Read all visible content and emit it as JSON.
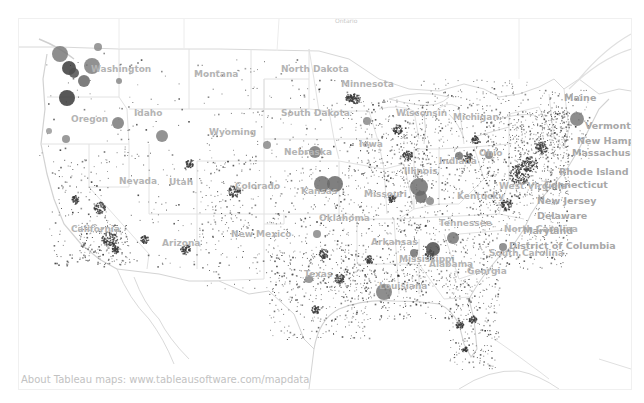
{
  "map": {
    "attribution": "About Tableau maps: www.tableausoftware.com/mapdata",
    "top_label": "Ontario",
    "colors": {
      "border": "#dcdcdc",
      "coast": "#d6d6d6",
      "label": "#b4b4b4",
      "dot": "#3a3a3a",
      "circle": "#6e6e6e"
    },
    "state_labels": [
      {
        "name": "Washington",
        "x": 72,
        "y": 53
      },
      {
        "name": "Oregon",
        "x": 52,
        "y": 103
      },
      {
        "name": "Idaho",
        "x": 115,
        "y": 97
      },
      {
        "name": "Montana",
        "x": 175,
        "y": 58
      },
      {
        "name": "Wyoming",
        "x": 190,
        "y": 116
      },
      {
        "name": "North Dakota",
        "x": 262,
        "y": 53
      },
      {
        "name": "South Dakota",
        "x": 262,
        "y": 97
      },
      {
        "name": "Minnesota",
        "x": 322,
        "y": 68
      },
      {
        "name": "Wisconsin",
        "x": 377,
        "y": 97
      },
      {
        "name": "Michigan",
        "x": 434,
        "y": 101
      },
      {
        "name": "Nebraska",
        "x": 265,
        "y": 136
      },
      {
        "name": "Iowa",
        "x": 340,
        "y": 128
      },
      {
        "name": "Nevada",
        "x": 100,
        "y": 165
      },
      {
        "name": "Utah",
        "x": 150,
        "y": 166
      },
      {
        "name": "Colorado",
        "x": 216,
        "y": 170
      },
      {
        "name": "Kansas",
        "x": 282,
        "y": 175
      },
      {
        "name": "Missouri",
        "x": 345,
        "y": 178
      },
      {
        "name": "Illinois",
        "x": 385,
        "y": 155
      },
      {
        "name": "Indiana",
        "x": 420,
        "y": 145
      },
      {
        "name": "Ohio",
        "x": 460,
        "y": 137
      },
      {
        "name": "Kentucky",
        "x": 438,
        "y": 180
      },
      {
        "name": "West Virginia",
        "x": 480,
        "y": 170
      },
      {
        "name": "California",
        "x": 52,
        "y": 213
      },
      {
        "name": "Arizona",
        "x": 143,
        "y": 227
      },
      {
        "name": "New Mexico",
        "x": 212,
        "y": 218
      },
      {
        "name": "Oklahoma",
        "x": 300,
        "y": 202
      },
      {
        "name": "Arkansas",
        "x": 352,
        "y": 226
      },
      {
        "name": "Tennessee",
        "x": 420,
        "y": 207
      },
      {
        "name": "North Carolina",
        "x": 485,
        "y": 213
      },
      {
        "name": "South Carolina",
        "x": 470,
        "y": 237
      },
      {
        "name": "Mississippi",
        "x": 380,
        "y": 243
      },
      {
        "name": "Alabama",
        "x": 410,
        "y": 248
      },
      {
        "name": "Georgia",
        "x": 448,
        "y": 255
      },
      {
        "name": "Texas",
        "x": 285,
        "y": 258
      },
      {
        "name": "Louisiana",
        "x": 360,
        "y": 270
      }
    ],
    "northeast_labels": [
      {
        "name": "Maine",
        "x": 545,
        "y": 82
      },
      {
        "name": "Vermont",
        "x": 566,
        "y": 110
      },
      {
        "name": "New Hamps",
        "x": 558,
        "y": 125
      },
      {
        "name": "Massachuse",
        "x": 553,
        "y": 137
      },
      {
        "name": "Rhode Island",
        "x": 540,
        "y": 156
      },
      {
        "name": "Connecticut",
        "x": 525,
        "y": 169
      },
      {
        "name": "New Jersey",
        "x": 518,
        "y": 185
      },
      {
        "name": "Delaware",
        "x": 518,
        "y": 200
      },
      {
        "name": "Maryland",
        "x": 504,
        "y": 215
      },
      {
        "name": "District of Columbia",
        "x": 490,
        "y": 230
      }
    ],
    "large_circles": [
      {
        "x": 41,
        "y": 35,
        "r": 8,
        "shade": "#7a7a7a"
      },
      {
        "x": 79,
        "y": 28,
        "r": 4,
        "shade": "#8a8a8a"
      },
      {
        "x": 50,
        "y": 49,
        "r": 7,
        "shade": "#3c3c3c"
      },
      {
        "x": 55,
        "y": 54,
        "r": 5,
        "shade": "#505050"
      },
      {
        "x": 73,
        "y": 47,
        "r": 8,
        "shade": "#7e7e7e"
      },
      {
        "x": 65,
        "y": 62,
        "r": 6,
        "shade": "#666666"
      },
      {
        "x": 100,
        "y": 62,
        "r": 3,
        "shade": "#8a8a8a"
      },
      {
        "x": 48,
        "y": 79,
        "r": 8,
        "shade": "#3a3a3a"
      },
      {
        "x": 99,
        "y": 104,
        "r": 6,
        "shade": "#7a7a7a"
      },
      {
        "x": 47,
        "y": 120,
        "r": 4,
        "shade": "#8a8a8a"
      },
      {
        "x": 30,
        "y": 112,
        "r": 3,
        "shade": "#999999"
      },
      {
        "x": 143,
        "y": 117,
        "r": 6,
        "shade": "#808080"
      },
      {
        "x": 248,
        "y": 126,
        "r": 4,
        "shade": "#8a8a8a"
      },
      {
        "x": 296,
        "y": 133,
        "r": 6,
        "shade": "#7a7a7a"
      },
      {
        "x": 348,
        "y": 102,
        "r": 4,
        "shade": "#8a8a8a"
      },
      {
        "x": 303,
        "y": 165,
        "r": 8,
        "shade": "#6e6e6e"
      },
      {
        "x": 316,
        "y": 165,
        "r": 8,
        "shade": "#6a6a6a"
      },
      {
        "x": 400,
        "y": 168,
        "r": 9,
        "shade": "#707070"
      },
      {
        "x": 402,
        "y": 178,
        "r": 6,
        "shade": "#6a6a6a"
      },
      {
        "x": 411,
        "y": 182,
        "r": 4,
        "shade": "#888888"
      },
      {
        "x": 434,
        "y": 219,
        "r": 6,
        "shade": "#777777"
      },
      {
        "x": 414,
        "y": 230,
        "r": 7,
        "shade": "#4e4e4e"
      },
      {
        "x": 395,
        "y": 234,
        "r": 4,
        "shade": "#707070"
      },
      {
        "x": 484,
        "y": 228,
        "r": 4,
        "shade": "#808080"
      },
      {
        "x": 365,
        "y": 273,
        "r": 8,
        "shade": "#7a7a7a"
      },
      {
        "x": 558,
        "y": 100,
        "r": 7,
        "shade": "#7a7a7a"
      },
      {
        "x": 470,
        "y": 136,
        "r": 4,
        "shade": "#808080"
      },
      {
        "x": 440,
        "y": 137,
        "r": 4,
        "shade": "#707070"
      },
      {
        "x": 298,
        "y": 215,
        "r": 4,
        "shade": "#888888"
      },
      {
        "x": 290,
        "y": 260,
        "r": 4,
        "shade": "#8a8a8a"
      }
    ],
    "dot_clusters": [
      {
        "x": 340,
        "y": 80,
        "w": 70,
        "h": 80,
        "n": 260
      },
      {
        "x": 280,
        "y": 60,
        "w": 60,
        "h": 90,
        "n": 90
      },
      {
        "x": 220,
        "y": 40,
        "w": 60,
        "h": 110,
        "n": 60
      },
      {
        "x": 100,
        "y": 40,
        "w": 120,
        "h": 100,
        "n": 70
      },
      {
        "x": 20,
        "y": 30,
        "w": 100,
        "h": 120,
        "n": 50
      },
      {
        "x": 30,
        "y": 140,
        "w": 60,
        "h": 110,
        "n": 140
      },
      {
        "x": 60,
        "y": 205,
        "w": 50,
        "h": 40,
        "n": 170
      },
      {
        "x": 110,
        "y": 140,
        "w": 100,
        "h": 110,
        "n": 90
      },
      {
        "x": 180,
        "y": 140,
        "w": 60,
        "h": 80,
        "n": 110
      },
      {
        "x": 180,
        "y": 190,
        "w": 80,
        "h": 80,
        "n": 90
      },
      {
        "x": 250,
        "y": 150,
        "w": 80,
        "h": 120,
        "n": 230
      },
      {
        "x": 250,
        "y": 230,
        "w": 100,
        "h": 90,
        "n": 280
      },
      {
        "x": 320,
        "y": 150,
        "w": 80,
        "h": 120,
        "n": 300
      },
      {
        "x": 380,
        "y": 120,
        "w": 100,
        "h": 150,
        "n": 520
      },
      {
        "x": 460,
        "y": 90,
        "w": 90,
        "h": 160,
        "n": 520
      },
      {
        "x": 490,
        "y": 90,
        "w": 60,
        "h": 90,
        "n": 320
      },
      {
        "x": 520,
        "y": 70,
        "w": 50,
        "h": 70,
        "n": 140
      },
      {
        "x": 400,
        "y": 60,
        "w": 110,
        "h": 60,
        "n": 180
      },
      {
        "x": 330,
        "y": 250,
        "w": 120,
        "h": 50,
        "n": 220
      },
      {
        "x": 430,
        "y": 260,
        "w": 50,
        "h": 90,
        "n": 200
      }
    ],
    "dense_spots": [
      {
        "x": 80,
        "y": 188,
        "r": 6
      },
      {
        "x": 90,
        "y": 219,
        "r": 8
      },
      {
        "x": 96,
        "y": 230,
        "r": 4
      },
      {
        "x": 56,
        "y": 180,
        "r": 4
      },
      {
        "x": 170,
        "y": 144,
        "r": 4
      },
      {
        "x": 215,
        "y": 172,
        "r": 6
      },
      {
        "x": 166,
        "y": 230,
        "r": 5
      },
      {
        "x": 125,
        "y": 220,
        "r": 4
      },
      {
        "x": 304,
        "y": 234,
        "r": 5
      },
      {
        "x": 320,
        "y": 259,
        "r": 5
      },
      {
        "x": 296,
        "y": 290,
        "r": 4
      },
      {
        "x": 330,
        "y": 78
      },
      {
        "x": 336,
        "y": 79,
        "r": 5
      },
      {
        "x": 372,
        "y": 179,
        "r": 4
      },
      {
        "x": 378,
        "y": 110,
        "r": 5
      },
      {
        "x": 388,
        "y": 136,
        "r": 5
      },
      {
        "x": 448,
        "y": 138,
        "r": 5
      },
      {
        "x": 456,
        "y": 120,
        "r": 4
      },
      {
        "x": 500,
        "y": 155,
        "r": 10
      },
      {
        "x": 510,
        "y": 145,
        "r": 8
      },
      {
        "x": 522,
        "y": 128,
        "r": 6
      },
      {
        "x": 487,
        "y": 185,
        "r": 6
      },
      {
        "x": 445,
        "y": 330,
        "r": 3
      },
      {
        "x": 440,
        "y": 305,
        "r": 4
      },
      {
        "x": 453,
        "y": 300,
        "r": 4
      },
      {
        "x": 410,
        "y": 235,
        "r": 5
      },
      {
        "x": 350,
        "y": 240,
        "r": 4
      }
    ]
  }
}
